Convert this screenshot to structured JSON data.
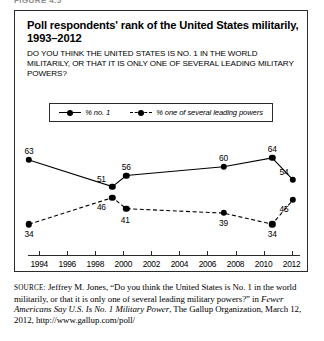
{
  "figure_label": "FIGURE 4.5",
  "title_line1": "Poll respondents' rank of the United States militarily,",
  "title_line2": "1993–2012",
  "question_line1": "DO YOU THINK THE UNITED STATES IS NO. 1 IN THE WORLD MILITARILY, OR",
  "question_line2": "THAT IT IS ONLY ONE OF SEVERAL LEADING MILITARY POWERS?",
  "legend": {
    "items": [
      {
        "label": "% no. 1",
        "style": "solid"
      },
      {
        "label": "% one of several leading powers",
        "style": "dashed"
      }
    ]
  },
  "source": {
    "prefix": "SOURCE:",
    "line1": " Jeffrey M. Jones, “Do you think the United States is No. 1 in",
    "line2": "the world militarily, or that it is only one of several leading military",
    "line3_a": "powers?” in ",
    "line3_italic": "Fewer Americans Say U.S. Is No. 1 Military Power",
    "line3_b": ", The",
    "line4": "Gallup Organization, March 12, 2012, http://www.gallup.com/poll/"
  },
  "chart_data": {
    "type": "line",
    "title": "Poll respondents' rank of the United States militarily, 1993–2012",
    "xlabel": "",
    "ylabel": "",
    "xlim": [
      1993,
      2012
    ],
    "ylim": [
      30,
      68
    ],
    "grid": false,
    "legend_position": "top",
    "xticks": [
      "1994",
      "1996",
      "1998",
      "2000",
      "2002",
      "2004",
      "2006",
      "2008",
      "2010",
      "2012"
    ],
    "series": [
      {
        "name": "% no. 1",
        "style": "solid",
        "points": [
          {
            "x": 1993,
            "y": 63,
            "label": "63"
          },
          {
            "x": 1999,
            "y": 51,
            "label": "51"
          },
          {
            "x": 2000,
            "y": 56,
            "label": "56"
          },
          {
            "x": 2007,
            "y": 60,
            "label": "60"
          },
          {
            "x": 2010.5,
            "y": 64,
            "label": "64"
          },
          {
            "x": 2012,
            "y": 54,
            "label": "54"
          }
        ]
      },
      {
        "name": "% one of several leading powers",
        "style": "dashed",
        "points": [
          {
            "x": 1993,
            "y": 34,
            "label": "34"
          },
          {
            "x": 1999,
            "y": 46,
            "label": "46"
          },
          {
            "x": 2000,
            "y": 41,
            "label": "41"
          },
          {
            "x": 2007,
            "y": 39,
            "label": "39"
          },
          {
            "x": 2010.5,
            "y": 34,
            "label": "34"
          },
          {
            "x": 2012,
            "y": 45,
            "label": "45"
          }
        ]
      }
    ]
  }
}
